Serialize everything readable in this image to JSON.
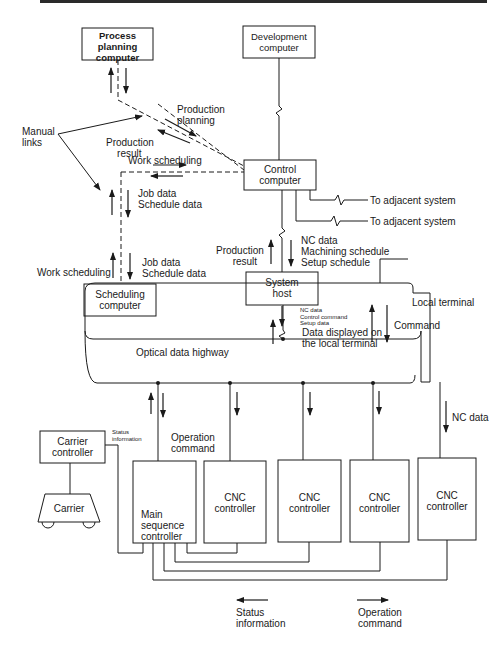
{
  "diagram": {
    "type": "system-architecture",
    "colors": {
      "line": "#1a1a1a",
      "background": "#ffffff"
    },
    "nodes": {
      "process_planning": "Process\nplanning\ncomputer",
      "development": "Development\ncomputer",
      "control": "Control\ncomputer",
      "scheduling": "Scheduling\ncomputer",
      "system_host": "System\nhost",
      "carrier_controller": "Carrier\ncontroller",
      "carrier": "Carrier",
      "main_sequence": "Main\nsequence\ncontroller",
      "cnc_1": "CNC\ncontroller",
      "cnc_2": "CNC\ncontroller",
      "cnc_3": "CNC\ncontroller",
      "cnc_4": "CNC\ncontroller"
    },
    "labels": {
      "manual_links": "Manual\nlinks",
      "production_planning": "Production\nplanning",
      "production_result_top": "Production\n    result",
      "work_scheduling_top": "Work scheduling",
      "job_data_1": "Job data\nSchedule data",
      "job_data_2": "Job data\nSchedule data",
      "work_scheduling_bottom": "Work scheduling",
      "to_adjacent_1": "To adjacent system",
      "to_adjacent_2": "To adjacent system",
      "nc_machining_setup": "NC data\nMachining schedule\nSetup schedule",
      "production_result_host": "Production\n      result",
      "host_small": "NC data\nControl command\nSetup data",
      "data_displayed": "Data displayed on\nthe local terminal",
      "local_terminal": "Local terminal",
      "command": "Command",
      "optical_highway": "Optical data highway",
      "status_information_small": "Status\ninformation",
      "operation_command": "Operation\ncommand",
      "nc_data_right": "NC data"
    },
    "legend": {
      "status": "Status\ninformation",
      "operation": "Operation\ncommand"
    }
  }
}
